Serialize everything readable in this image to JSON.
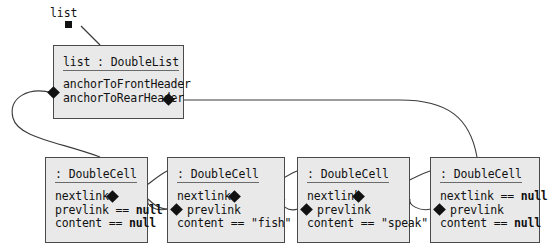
{
  "diagram": {
    "colors": {
      "box_fill": "#e9e9e9",
      "box_border": "#4a4a4a",
      "link": "#3c3c3c",
      "text": "#111111"
    },
    "root_label": "list",
    "objects": [
      {
        "id": "list",
        "header": "list : DoubleList",
        "attributes": [
          {
            "name": "anchorToFrontHeader",
            "text": "anchorToFrontHeader",
            "end": "left-diamond"
          },
          {
            "name": "anchorToRearHeader",
            "text": "anchorToRearHeader",
            "end": "right-diamond"
          }
        ]
      },
      {
        "id": "cell1",
        "header": ": DoubleCell",
        "attributes": [
          {
            "name": "nextlink",
            "text": "nextlink",
            "end": "right-diamond"
          },
          {
            "name": "prevlink",
            "text": "prevlink == ",
            "value": "null",
            "end": "none"
          },
          {
            "name": "content",
            "text": "content == ",
            "value": "null",
            "end": "none"
          }
        ]
      },
      {
        "id": "cell2",
        "header": ": DoubleCell",
        "attributes": [
          {
            "name": "nextlink",
            "text": "nextlink",
            "end": "right-diamond"
          },
          {
            "name": "prevlink",
            "text": "prevlink",
            "end": "left-diamond"
          },
          {
            "name": "content",
            "text": "content == \"fish\"",
            "end": "none"
          }
        ]
      },
      {
        "id": "cell3",
        "header": ": DoubleCell",
        "attributes": [
          {
            "name": "nextlink",
            "text": "nextlink",
            "end": "right-diamond"
          },
          {
            "name": "prevlink",
            "text": "prevlink",
            "end": "left-diamond"
          },
          {
            "name": "content",
            "text": "content == \"speak\"",
            "end": "none"
          }
        ]
      },
      {
        "id": "cell4",
        "header": ": DoubleCell",
        "attributes": [
          {
            "name": "nextlink",
            "text": "nextlink == ",
            "value": "null",
            "end": "none"
          },
          {
            "name": "prevlink",
            "text": "prevlink",
            "end": "left-diamond"
          },
          {
            "name": "content",
            "text": "content == ",
            "value": "null",
            "end": "none"
          }
        ]
      }
    ]
  }
}
